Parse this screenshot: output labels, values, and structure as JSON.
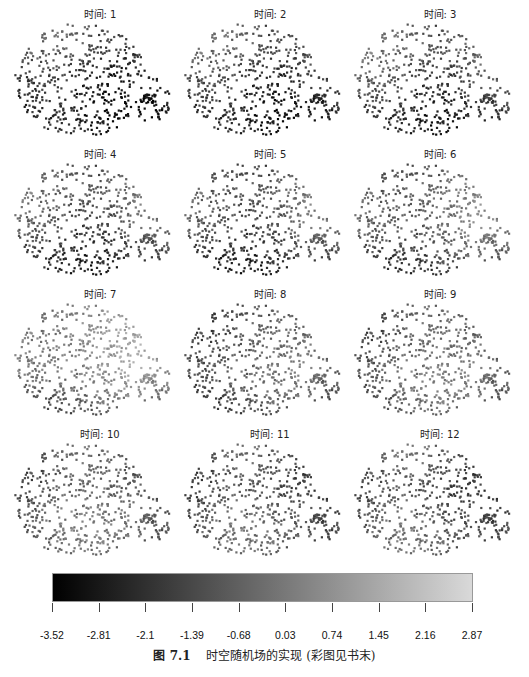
{
  "chart_data": {
    "type": "scatter",
    "layout": "small-multiples 4x3 spatial scatter maps",
    "panel_title_prefix": "时间: ",
    "panels": [
      {
        "title": "时间: 1",
        "time": 1,
        "mean_level": -2.4
      },
      {
        "title": "时间: 2",
        "time": 2,
        "mean_level": -2.1
      },
      {
        "title": "时间: 3",
        "time": 3,
        "mean_level": -1.8
      },
      {
        "title": "时间: 4",
        "time": 4,
        "mean_level": -1.6
      },
      {
        "title": "时间: 5",
        "time": 5,
        "mean_level": -1.7
      },
      {
        "title": "时间: 6",
        "time": 6,
        "mean_level": -1.3
      },
      {
        "title": "时间: 7",
        "time": 7,
        "mean_level": -0.8
      },
      {
        "title": "时间: 8",
        "time": 8,
        "mean_level": -1.5
      },
      {
        "title": "时间: 9",
        "time": 9,
        "mean_level": -1.2
      },
      {
        "title": "时间: 10",
        "time": 10,
        "mean_level": -1.2
      },
      {
        "title": "时间: 11",
        "time": 11,
        "mean_level": -1.5
      },
      {
        "title": "时间: 12",
        "time": 12,
        "mean_level": -1.4
      }
    ],
    "colorbar": {
      "colormap": "grayscale (dark = low, light = high)",
      "ticks": [
        "-3.52",
        "-2.81",
        "-2.1",
        "-1.39",
        "-0.68",
        "0.03",
        "0.74",
        "1.45",
        "2.16",
        "2.87"
      ],
      "range": [
        -3.52,
        2.87
      ],
      "color_low": "#000000",
      "color_high": "#d9d9d9"
    },
    "grid": false,
    "legend_position": "bottom colorbar"
  },
  "caption": {
    "figure_label": "图 7.1",
    "text": "时空随机场的实现 (彩图见书末)"
  }
}
